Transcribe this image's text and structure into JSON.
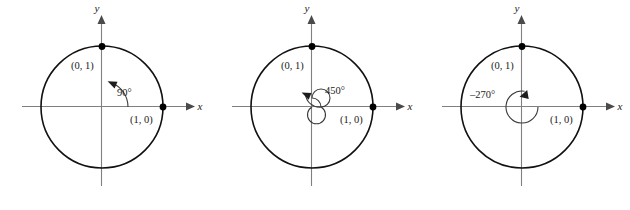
{
  "figure": {
    "type": "unit-circle-angle-diagrams",
    "panel_count": 3,
    "colors": {
      "circle_stroke": "#111111",
      "axis_stroke": "#808080",
      "arc_stroke": "#3a3a3a",
      "point_fill": "#000000",
      "text_fill": "#1a1a1a",
      "background": "#ffffff"
    }
  },
  "panels": [
    {
      "id": "panel-90",
      "angle_label": "90°",
      "angle_degrees": 90,
      "direction": "counterclockwise",
      "revolutions": 0.25,
      "axis_x_label": "x",
      "axis_y_label": "y",
      "point_right_label": "(1, 0)",
      "point_top_label": "(0, 1)",
      "circle_radius": 61,
      "center": {
        "x": 102,
        "y": 107
      },
      "arc_radius": 26
    },
    {
      "id": "panel-450",
      "angle_label": "450°",
      "angle_degrees": 450,
      "direction": "counterclockwise",
      "revolutions": 1.25,
      "axis_x_label": "x",
      "axis_y_label": "y",
      "point_right_label": "(1, 0)",
      "point_top_label": "(0, 1)",
      "circle_radius": 61,
      "center": {
        "x": 312,
        "y": 107
      },
      "arc_radius": 14
    },
    {
      "id": "panel-minus-270",
      "angle_label": "–270°",
      "angle_degrees": -270,
      "direction": "clockwise",
      "revolutions": 0.75,
      "axis_x_label": "x",
      "axis_y_label": "y",
      "point_right_label": "(1, 0)",
      "point_top_label": "(0, 1)",
      "circle_radius": 61,
      "center": {
        "x": 522,
        "y": 107
      },
      "arc_radius": 16
    }
  ]
}
